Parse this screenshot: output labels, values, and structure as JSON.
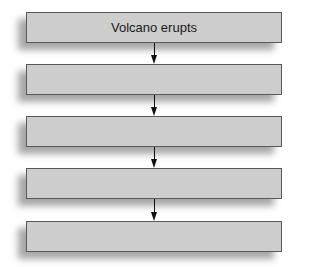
{
  "diagram": {
    "type": "vertical-flowchart",
    "boxes": [
      {
        "label": "Volcano erupts"
      },
      {
        "label": ""
      },
      {
        "label": ""
      },
      {
        "label": ""
      },
      {
        "label": ""
      }
    ],
    "connectors": [
      {
        "from": 0,
        "to": 1,
        "style": "arrow-down"
      },
      {
        "from": 1,
        "to": 2,
        "style": "arrow-down"
      },
      {
        "from": 2,
        "to": 3,
        "style": "arrow-down"
      },
      {
        "from": 3,
        "to": 4,
        "style": "arrow-down"
      }
    ],
    "colors": {
      "box_fill": "#cdcdcd",
      "box_border": "#5a5a5a",
      "arrow": "#111111"
    }
  }
}
